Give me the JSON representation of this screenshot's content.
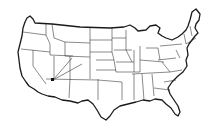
{
  "map": {
    "title": "",
    "type": "outline map",
    "region": "Contiguous United States",
    "features": [
      "state borders",
      "coastline outline"
    ],
    "colors": {
      "background": "#ffffff",
      "lines": "#1a1a1a"
    },
    "marker": {
      "name": "point-marker",
      "approx_location": "Southern Nevada"
    },
    "routes": [
      {
        "from": "Southern Nevada marker",
        "to": "Colorado / Utah (northeast)"
      },
      {
        "from": "Southern Nevada marker",
        "to": "Utah / Wyoming (north-northeast)"
      }
    ]
  }
}
